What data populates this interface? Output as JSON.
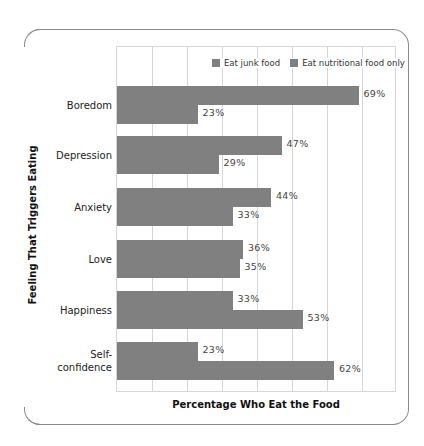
{
  "chart_data": {
    "type": "bar",
    "orientation": "horizontal",
    "title": "",
    "xlabel": "Percentage Who Eat the Food",
    "ylabel": "Feeling That Triggers Eating",
    "xlim": [
      0,
      80
    ],
    "grid_step": 10,
    "grid": true,
    "legend_position": "top-right inside",
    "categories": [
      "Boredom",
      "Depression",
      "Anxiety",
      "Love",
      "Happiness",
      "Self-\nconfidence"
    ],
    "series": [
      {
        "name": "Eat junk food",
        "color": "#808080",
        "values": [
          69,
          47,
          44,
          36,
          33,
          23
        ]
      },
      {
        "name": "Eat nutritional food only",
        "color": "#808080",
        "values": [
          23,
          29,
          33,
          35,
          53,
          62
        ]
      }
    ],
    "value_labels": [
      [
        "69%",
        "47%",
        "44%",
        "36%",
        "33%",
        "23%"
      ],
      [
        "23%",
        "29%",
        "33%",
        "35%",
        "53%",
        "62%"
      ]
    ]
  }
}
